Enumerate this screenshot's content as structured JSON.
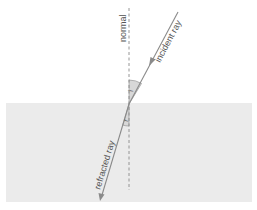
{
  "diagram": {
    "labels": {
      "normal": "normal",
      "incident_ray": "incident ray",
      "refracted_ray": "refracted ray",
      "angle_incidence": "i",
      "angle_refraction": "r"
    },
    "colors": {
      "background": "#ffffff",
      "medium": "#ebebeb",
      "ray": "#8a8a8a",
      "normal_line": "#8a8a8a",
      "angle_fill": "#d8d8d8",
      "text": "#555555"
    }
  }
}
